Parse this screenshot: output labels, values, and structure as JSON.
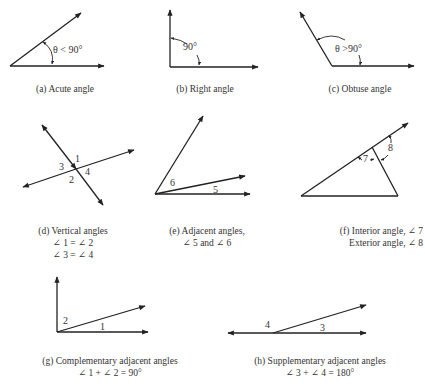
{
  "figures": {
    "a": {
      "caption": "(a)  Acute angle",
      "label": "θ < 90°"
    },
    "b": {
      "caption": "(b)  Right angle",
      "label": "90°"
    },
    "c": {
      "caption": "(c)  Obtuse angle",
      "label": "θ >90°"
    },
    "d": {
      "caption": "(d)  Vertical angles",
      "line2": "∠ 1 = ∠ 2",
      "line3": "∠ 3 = ∠ 4",
      "labels": [
        "1",
        "2",
        "3",
        "4"
      ]
    },
    "e": {
      "caption": "(e)  Adjacent angles,",
      "line2": "∠ 5 and ∠ 6",
      "labels": [
        "5",
        "6"
      ]
    },
    "f": {
      "caption": "(f)  Interior angle,  ∠ 7",
      "line2": "Exterior angle, ∠ 8",
      "labels": [
        "7",
        "8"
      ]
    },
    "g": {
      "caption": "(g)  Complementary adjacent angles",
      "line2": "∠ 1 + ∠ 2 = 90°",
      "labels": [
        "1",
        "2"
      ]
    },
    "h": {
      "caption": "(h)  Supplementary adjacent angles",
      "line2": "∠ 3 + ∠ 4 = 180°",
      "labels": [
        "3",
        "4"
      ]
    }
  }
}
